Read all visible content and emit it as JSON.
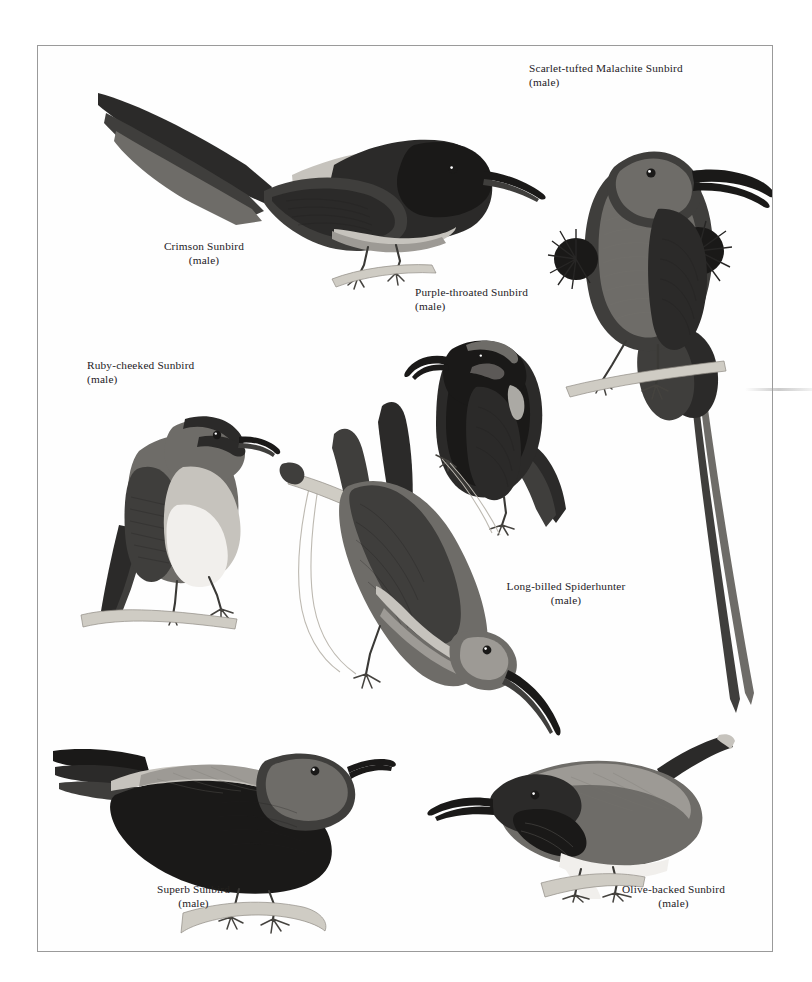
{
  "plate": {
    "title": "Sunbirds plate",
    "background_color": "#ffffff",
    "frame_color": "#9a9a9a",
    "frame": {
      "x": 37,
      "y": 45,
      "width": 736,
      "height": 907
    }
  },
  "figures": [
    {
      "id": "crimson-sunbird",
      "name": "Crimson Sunbird",
      "sex": "(male)",
      "caption_align": "center",
      "caption": {
        "x": 133,
        "y": 238,
        "width": 140
      },
      "figure": {
        "x": 95,
        "y": 78,
        "width": 400,
        "height": 200
      }
    },
    {
      "id": "scarlet-tufted-malachite-sunbird",
      "name": "Scarlet-tufted Malachite Sunbird",
      "sex": "(male)",
      "caption_align": "left",
      "caption": {
        "x": 528,
        "y": 60,
        "width": 230
      },
      "figure": {
        "x": 545,
        "y": 78,
        "width": 210,
        "height": 650
      }
    },
    {
      "id": "purple-throated-sunbird",
      "name": "Purple-throated Sunbird",
      "sex": "(male)",
      "caption_align": "left",
      "caption": {
        "x": 414,
        "y": 284,
        "width": 160
      },
      "figure": {
        "x": 405,
        "y": 300,
        "width": 200,
        "height": 225
      }
    },
    {
      "id": "ruby-cheeked-sunbird",
      "name": "Ruby-cheeked Sunbird",
      "sex": "(male)",
      "caption_align": "left",
      "caption": {
        "x": 86,
        "y": 357,
        "width": 150
      },
      "figure": {
        "x": 80,
        "y": 374,
        "width": 190,
        "height": 240
      }
    },
    {
      "id": "long-billed-spiderhunter",
      "name": "Long-billed Spiderhunter",
      "sex": "(male)",
      "caption_align": "center",
      "caption": {
        "x": 470,
        "y": 578,
        "width": 185
      },
      "figure": {
        "x": 255,
        "y": 375,
        "width": 340,
        "height": 355
      }
    },
    {
      "id": "superb-sunbird",
      "name": "Superb Sunbird",
      "sex": "(male)",
      "caption_align": "center",
      "caption": {
        "x": 110,
        "y": 881,
        "width": 160
      },
      "figure": {
        "x": 52,
        "y": 690,
        "width": 330,
        "height": 205
      }
    },
    {
      "id": "olive-backed-sunbird",
      "name": "Olive-backed Sunbird",
      "sex": "(male)",
      "caption_align": "center",
      "caption": {
        "x": 585,
        "y": 881,
        "width": 170
      },
      "figure": {
        "x": 400,
        "y": 706,
        "width": 330,
        "height": 185
      }
    }
  ]
}
